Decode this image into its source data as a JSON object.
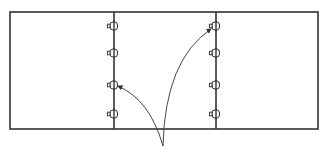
{
  "diagram": {
    "stroke_color": "#333333",
    "background": "#ffffff",
    "frame": {
      "x": 10,
      "y": 12,
      "width": 308,
      "height": 117
    },
    "panels": [
      {
        "id": "panel-left",
        "x1": 10,
        "x2": 114
      },
      {
        "id": "panel-middle",
        "x1": 114,
        "x2": 216
      },
      {
        "id": "panel-right",
        "x1": 216,
        "x2": 318
      }
    ],
    "dividers": [
      {
        "id": "divider-1",
        "x": 114,
        "hinge_y": [
          26,
          53,
          85,
          114
        ]
      },
      {
        "id": "divider-2",
        "x": 216,
        "hinge_y": [
          26,
          53,
          85,
          114
        ]
      }
    ],
    "arrows": [
      {
        "id": "arrow-to-divider-1",
        "from": [
          163,
          146
        ],
        "ctrl": [
          150,
          100
        ],
        "to": [
          118,
          86
        ]
      },
      {
        "id": "arrow-to-divider-2",
        "from": [
          163,
          146
        ],
        "ctrl": [
          165,
          60
        ],
        "to": [
          211,
          29
        ]
      }
    ],
    "labels": []
  }
}
